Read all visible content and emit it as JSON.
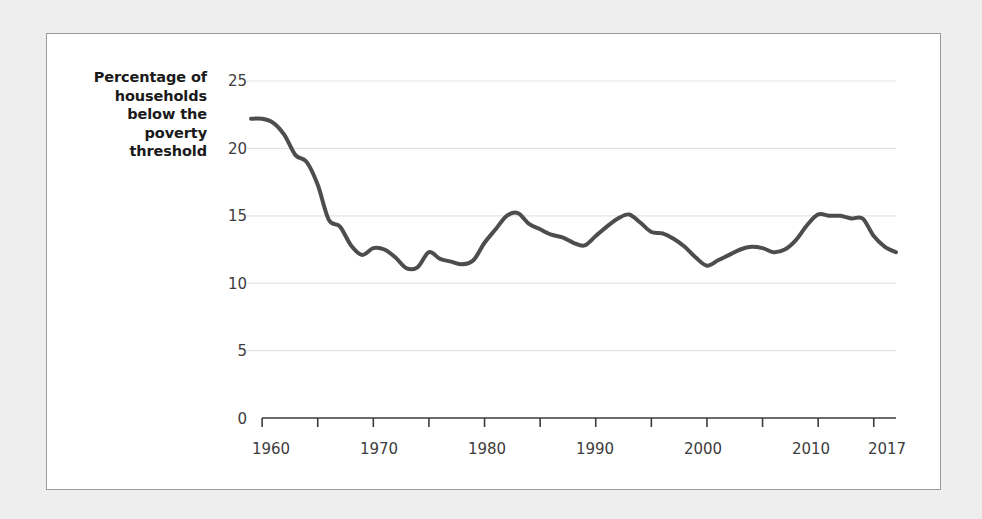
{
  "chart_data": {
    "type": "line",
    "title": "",
    "xlabel": "",
    "ylabel": "Percentage of households below the poverty threshold",
    "ylabel_lines": [
      "Percentage of",
      "households",
      "below the",
      "poverty",
      "threshold"
    ],
    "xlim": [
      1959,
      2017
    ],
    "ylim": [
      0,
      26
    ],
    "grid": "horizontal",
    "legend": "none",
    "series_color": "#4d4d4d",
    "grid_color": "#e3e3e3",
    "axis_color": "#3d3d3d",
    "ytick_labels": [
      "25",
      "20",
      "15",
      "10",
      "5",
      "0"
    ],
    "ytick_values": [
      25,
      20,
      15,
      10,
      5,
      0
    ],
    "xtick_values": [
      1960,
      1965,
      1970,
      1975,
      1980,
      1985,
      1990,
      1995,
      2000,
      2005,
      2010,
      2015
    ],
    "xtick_labels_shown": [
      "1960",
      "1970",
      "1980",
      "1990",
      "2000",
      "2010",
      "2017"
    ],
    "xtick_labels_positions": [
      1960,
      1970,
      1980,
      1990,
      2000,
      2010,
      2017
    ],
    "series": [
      {
        "name": "Percentage of households below the poverty threshold",
        "x": [
          1959,
          1960,
          1961,
          1962,
          1963,
          1964,
          1965,
          1966,
          1967,
          1968,
          1969,
          1970,
          1971,
          1972,
          1973,
          1974,
          1975,
          1976,
          1977,
          1978,
          1979,
          1980,
          1981,
          1982,
          1983,
          1984,
          1985,
          1986,
          1987,
          1988,
          1989,
          1990,
          1991,
          1992,
          1993,
          1994,
          1995,
          1996,
          1997,
          1998,
          1999,
          2000,
          2001,
          2002,
          2003,
          2004,
          2005,
          2006,
          2007,
          2008,
          2009,
          2010,
          2011,
          2012,
          2013,
          2014,
          2015,
          2016,
          2017
        ],
        "values": [
          22.2,
          22.2,
          21.9,
          21.0,
          19.5,
          19.0,
          17.3,
          14.7,
          14.2,
          12.8,
          12.1,
          12.6,
          12.5,
          11.9,
          11.1,
          11.2,
          12.3,
          11.8,
          11.6,
          11.4,
          11.7,
          13.0,
          14.0,
          15.0,
          15.2,
          14.4,
          14.0,
          13.6,
          13.4,
          13.0,
          12.8,
          13.5,
          14.2,
          14.8,
          15.1,
          14.5,
          13.8,
          13.7,
          13.3,
          12.7,
          11.9,
          11.3,
          11.7,
          12.1,
          12.5,
          12.7,
          12.6,
          12.3,
          12.5,
          13.2,
          14.3,
          15.1,
          15.0,
          15.0,
          14.8,
          14.8,
          13.5,
          12.7,
          12.3
        ]
      }
    ]
  },
  "figure": {
    "background": "#eeeeee",
    "card_background": "#ffffff",
    "card_border": "#9a9a9a"
  }
}
